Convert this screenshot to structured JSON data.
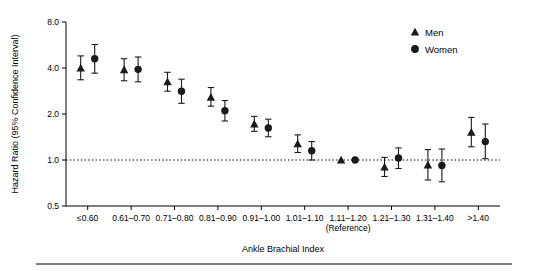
{
  "chart_data": {
    "type": "scatter",
    "title": "",
    "xlabel": "Ankle Brachial Index",
    "ylabel": "Hazard Ratio (95% Confidence Interval)",
    "yscale": "log",
    "ylim": [
      0.5,
      8.0
    ],
    "yticks": [
      "0.5",
      "1.0",
      "2.0",
      "4.0",
      "8.0"
    ],
    "ytick_values": [
      0.5,
      1.0,
      2.0,
      4.0,
      8.0
    ],
    "categories": [
      "≤0.60",
      "0.61–0.70",
      "0.71–0.80",
      "0.81–0.90",
      "0.91–1.00",
      "1.01–1.10",
      "1.11–1.20",
      "1.21–1.30",
      "1.31–1.40",
      ">1.40"
    ],
    "reference_category": "1.11–1.20",
    "reference_note": "(Reference)",
    "reference_line_y": 1.0,
    "grid": false,
    "legend_position": "top-right",
    "series": [
      {
        "name": "Men",
        "marker": "triangle",
        "color": "#1a1a1a",
        "values": [
          4.0,
          3.9,
          3.25,
          2.58,
          1.72,
          1.28,
          1.0,
          0.9,
          0.93,
          1.52
        ],
        "lower": [
          3.35,
          3.3,
          2.82,
          2.25,
          1.54,
          1.12,
          1.0,
          0.78,
          0.74,
          1.22
        ],
        "upper": [
          4.8,
          4.6,
          3.75,
          2.98,
          1.93,
          1.46,
          1.0,
          1.04,
          1.17,
          1.9
        ]
      },
      {
        "name": "Women",
        "marker": "circle",
        "color": "#1a1a1a",
        "values": [
          4.6,
          3.92,
          2.82,
          2.1,
          1.62,
          1.15,
          1.0,
          1.03,
          0.92,
          1.32
        ],
        "lower": [
          3.7,
          3.25,
          2.35,
          1.8,
          1.42,
          1.0,
          1.0,
          0.88,
          0.72,
          1.02
        ],
        "upper": [
          5.7,
          4.72,
          3.38,
          2.45,
          1.85,
          1.32,
          1.0,
          1.2,
          1.18,
          1.72
        ]
      }
    ],
    "legend": [
      {
        "label": "Men",
        "marker": "triangle"
      },
      {
        "label": "Women",
        "marker": "circle"
      }
    ]
  }
}
